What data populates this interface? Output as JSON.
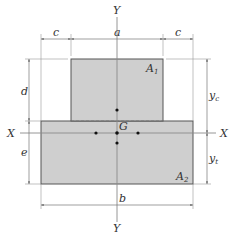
{
  "diagram": {
    "type": "T-section cross-section",
    "colors": {
      "fill": "#cfcfcf",
      "stroke": "#555555",
      "axis": "#8a8a8a",
      "dim": "#777777",
      "dot": "#111111",
      "text": "#333333"
    },
    "axes": {
      "y_top": "Y",
      "y_bottom": "Y",
      "x_left": "X",
      "x_right": "X"
    },
    "centroid": {
      "label": "G"
    },
    "areas": {
      "upper": {
        "label": "A",
        "sub": "1"
      },
      "lower": {
        "label": "A",
        "sub": "2"
      }
    },
    "dimensions": {
      "top_left": "c",
      "top_middle": "a",
      "top_right": "c",
      "left_upper": "d",
      "left_lower": "e",
      "right_upper": {
        "label": "y",
        "sub": "c"
      },
      "right_lower": {
        "label": "y",
        "sub": "t"
      },
      "bottom": "b"
    }
  }
}
